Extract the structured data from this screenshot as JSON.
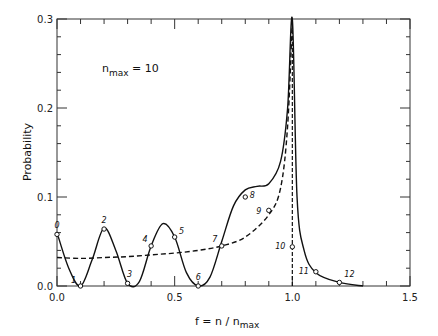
{
  "chart_data": {
    "type": "line",
    "title": "",
    "annotation": "n_max = 10",
    "annotation_parts": {
      "n": "n",
      "sub": "max",
      "rest": " = 10"
    },
    "xlabel": "f = n / n_max",
    "xlabel_parts": {
      "main": "f = n / n",
      "sub": "max"
    },
    "ylabel": "Probability",
    "xlim": [
      0.0,
      1.5
    ],
    "ylim": [
      0.0,
      0.3
    ],
    "x_ticks": [
      "0.0",
      "0.5",
      "1.0",
      "1.5"
    ],
    "y_ticks": [
      "0.0",
      "0.1",
      "0.2",
      "0.3"
    ],
    "grid": false,
    "legend": null,
    "series": [
      {
        "name": "quantum probability (solid)",
        "style": "solid",
        "x": [
          0.0,
          0.05,
          0.1,
          0.15,
          0.2,
          0.25,
          0.3,
          0.35,
          0.4,
          0.45,
          0.5,
          0.55,
          0.6,
          0.65,
          0.7,
          0.75,
          0.8,
          0.85,
          0.9,
          0.95,
          0.98,
          1.0,
          1.02,
          1.05,
          1.1,
          1.2,
          1.3
        ],
        "values": [
          0.06,
          0.02,
          0.0,
          0.03,
          0.065,
          0.04,
          0.003,
          0.005,
          0.045,
          0.07,
          0.055,
          0.015,
          0.0,
          0.01,
          0.05,
          0.09,
          0.108,
          0.112,
          0.115,
          0.14,
          0.2,
          0.3,
          0.1,
          0.04,
          0.015,
          0.004,
          0.0
        ]
      },
      {
        "name": "classical probability (dashed)",
        "style": "dashed",
        "x": [
          0.0,
          0.1,
          0.2,
          0.3,
          0.4,
          0.5,
          0.6,
          0.7,
          0.8,
          0.9,
          0.95,
          0.98,
          1.0
        ],
        "values": [
          0.032,
          0.031,
          0.032,
          0.033,
          0.035,
          0.037,
          0.04,
          0.045,
          0.055,
          0.08,
          0.11,
          0.18,
          0.3
        ]
      }
    ],
    "labeled_points": [
      {
        "label": "0",
        "x": 0.0,
        "y": 0.058
      },
      {
        "label": "1",
        "x": 0.1,
        "y": 0.0
      },
      {
        "label": "2",
        "x": 0.2,
        "y": 0.064
      },
      {
        "label": "3",
        "x": 0.3,
        "y": 0.003
      },
      {
        "label": "4",
        "x": 0.4,
        "y": 0.045
      },
      {
        "label": "5",
        "x": 0.5,
        "y": 0.055
      },
      {
        "label": "6",
        "x": 0.6,
        "y": 0.0
      },
      {
        "label": "7",
        "x": 0.7,
        "y": 0.045
      },
      {
        "label": "8",
        "x": 0.8,
        "y": 0.1
      },
      {
        "label": "9",
        "x": 0.9,
        "y": 0.085
      },
      {
        "label": "10",
        "x": 1.0,
        "y": 0.044
      },
      {
        "label": "11",
        "x": 1.1,
        "y": 0.016
      },
      {
        "label": "12",
        "x": 1.2,
        "y": 0.004
      }
    ]
  }
}
